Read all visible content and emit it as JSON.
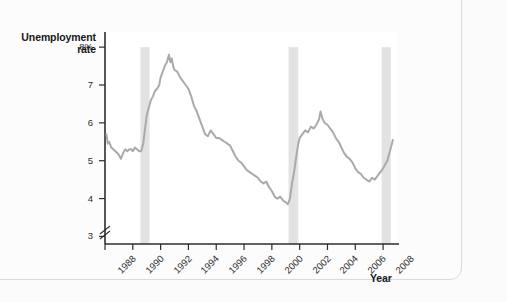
{
  "figure": {
    "y_axis_title": "Unemployment\nrate",
    "y_axis_title_line1": "Unemployment",
    "y_axis_title_line2": "rate",
    "x_axis_title": "Year"
  },
  "colors": {
    "line": "#aaaaaa",
    "recession_band": "#e2e2e2",
    "axis": "#2b2c2e",
    "plot_background": "#ffffff",
    "page_background": "#fbfbfb",
    "frame_border": "#d9dcdd",
    "tick_text": "#2b2c2e"
  },
  "chart_data": {
    "type": "line",
    "title": "",
    "subtitle": "",
    "xlabel": "Year",
    "ylabel": "Unemployment rate",
    "xlim": [
      1988.0,
      2009.0
    ],
    "ylim": [
      2.8,
      8.4
    ],
    "y_axis_break": true,
    "grid": false,
    "legend": null,
    "legend_position": "none",
    "y_ticks": [
      {
        "value": 8,
        "label": "8%"
      },
      {
        "value": 7,
        "label": "7"
      },
      {
        "value": 6,
        "label": "6"
      },
      {
        "value": 5,
        "label": "5"
      },
      {
        "value": 4,
        "label": "4"
      },
      {
        "value": 3,
        "label": "3"
      }
    ],
    "x_ticks": [
      {
        "value": 1988,
        "label": "1988"
      },
      {
        "value": 1990,
        "label": "1990"
      },
      {
        "value": 1992,
        "label": "1992"
      },
      {
        "value": 1994,
        "label": "1994"
      },
      {
        "value": 1996,
        "label": "1996"
      },
      {
        "value": 1998,
        "label": "1998"
      },
      {
        "value": 2000,
        "label": "2000"
      },
      {
        "value": 2002,
        "label": "2002"
      },
      {
        "value": 2004,
        "label": "2004"
      },
      {
        "value": 2006,
        "label": "2006"
      },
      {
        "value": 2008,
        "label": "2008"
      }
    ],
    "shaded_regions": [
      {
        "name": "recession-1990-1991",
        "x_start": 1990.55,
        "x_end": 1991.2
      },
      {
        "name": "recession-2001",
        "x_start": 2001.2,
        "x_end": 2001.9
      },
      {
        "name": "recession-2007-2009",
        "x_start": 2007.9,
        "x_end": 2008.55
      }
    ],
    "series": [
      {
        "name": "Unemployment rate",
        "color": "#aaaaaa",
        "x": [
          1988.1,
          1988.2,
          1988.3,
          1988.45,
          1988.6,
          1988.75,
          1988.9,
          1989.0,
          1989.15,
          1989.3,
          1989.45,
          1989.6,
          1989.75,
          1989.9,
          1990.0,
          1990.15,
          1990.3,
          1990.45,
          1990.6,
          1990.75,
          1990.9,
          1991.0,
          1991.15,
          1991.3,
          1991.45,
          1991.6,
          1991.75,
          1991.9,
          1992.0,
          1992.15,
          1992.3,
          1992.45,
          1992.6,
          1992.7,
          1992.8,
          1992.9,
          1993.0,
          1993.2,
          1993.4,
          1993.6,
          1993.8,
          1994.0,
          1994.2,
          1994.4,
          1994.6,
          1994.8,
          1995.0,
          1995.2,
          1995.4,
          1995.6,
          1995.8,
          1996.0,
          1996.2,
          1996.4,
          1996.6,
          1996.8,
          1997.0,
          1997.2,
          1997.4,
          1997.6,
          1997.8,
          1998.0,
          1998.2,
          1998.4,
          1998.6,
          1998.8,
          1999.0,
          1999.2,
          1999.4,
          1999.6,
          1999.8,
          2000.0,
          2000.2,
          2000.4,
          2000.6,
          2000.8,
          2001.0,
          2001.15,
          2001.3,
          2001.45,
          2001.6,
          2001.75,
          2001.9,
          2002.0,
          2002.2,
          2002.4,
          2002.6,
          2002.8,
          2003.0,
          2003.2,
          2003.4,
          2003.5,
          2003.65,
          2003.8,
          2004.0,
          2004.2,
          2004.4,
          2004.6,
          2004.8,
          2005.0,
          2005.2,
          2005.4,
          2005.6,
          2005.8,
          2006.0,
          2006.2,
          2006.4,
          2006.6,
          2006.8,
          2007.0,
          2007.2,
          2007.4,
          2007.6,
          2007.8,
          2008.0,
          2008.15,
          2008.3,
          2008.45,
          2008.6,
          2008.7
        ],
        "y": [
          5.7,
          5.45,
          5.5,
          5.35,
          5.3,
          5.25,
          5.2,
          5.15,
          5.05,
          5.2,
          5.3,
          5.25,
          5.3,
          5.3,
          5.25,
          5.35,
          5.3,
          5.25,
          5.25,
          5.45,
          5.9,
          6.2,
          6.4,
          6.6,
          6.7,
          6.85,
          6.9,
          7.0,
          7.2,
          7.35,
          7.5,
          7.6,
          7.8,
          7.6,
          7.7,
          7.5,
          7.4,
          7.35,
          7.2,
          7.1,
          7.0,
          6.9,
          6.7,
          6.45,
          6.3,
          6.1,
          5.9,
          5.7,
          5.65,
          5.8,
          5.7,
          5.6,
          5.6,
          5.55,
          5.5,
          5.45,
          5.4,
          5.25,
          5.1,
          5.0,
          4.95,
          4.85,
          4.75,
          4.7,
          4.65,
          4.6,
          4.55,
          4.45,
          4.4,
          4.45,
          4.3,
          4.2,
          4.05,
          4.0,
          4.05,
          3.95,
          3.9,
          3.85,
          4.0,
          4.4,
          4.7,
          5.1,
          5.45,
          5.6,
          5.7,
          5.8,
          5.75,
          5.9,
          5.85,
          5.95,
          6.1,
          6.3,
          6.1,
          6.0,
          5.95,
          5.85,
          5.75,
          5.6,
          5.5,
          5.35,
          5.2,
          5.1,
          5.05,
          4.95,
          4.8,
          4.7,
          4.65,
          4.55,
          4.5,
          4.45,
          4.55,
          4.5,
          4.6,
          4.7,
          4.8,
          4.9,
          5.0,
          5.2,
          5.4,
          5.55
        ]
      }
    ],
    "annotations": []
  }
}
